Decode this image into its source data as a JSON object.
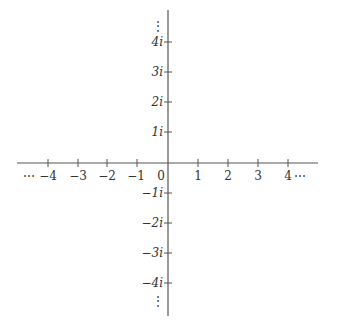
{
  "diagram": {
    "axis_color": "#555555",
    "real_axis": {
      "ticks": [
        {
          "value": -4,
          "label": "−4",
          "prefix": "⋯"
        },
        {
          "value": -3,
          "label": "−3"
        },
        {
          "value": -2,
          "label": "−2"
        },
        {
          "value": -1,
          "label": "−1"
        },
        {
          "value": 1,
          "label": "1"
        },
        {
          "value": 2,
          "label": "2"
        },
        {
          "value": 3,
          "label": "3"
        },
        {
          "value": 4,
          "label": "4",
          "suffix": "⋯"
        }
      ],
      "origin_label": "0"
    },
    "imaginary_axis": {
      "ticks": [
        {
          "value": 4,
          "label": "4i"
        },
        {
          "value": 3,
          "label": "3i"
        },
        {
          "value": 2,
          "label": "2i"
        },
        {
          "value": 1,
          "label": "1i"
        },
        {
          "value": -1,
          "label": "−1i"
        },
        {
          "value": -2,
          "label": "−2i"
        },
        {
          "value": -3,
          "label": "−3i"
        },
        {
          "value": -4,
          "label": "−4i"
        }
      ],
      "top_ellipsis": "⋮",
      "bottom_ellipsis": "⋮"
    }
  }
}
